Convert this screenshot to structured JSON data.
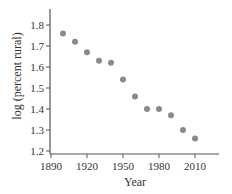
{
  "chart_data": {
    "type": "scatter",
    "title": "",
    "xlabel": "Year",
    "ylabel": "log (percent rural)",
    "xlim": [
      1890,
      2025
    ],
    "ylim": [
      1.19,
      1.88
    ],
    "x_ticks": [
      1890,
      1920,
      1950,
      1980,
      2010
    ],
    "y_ticks": [
      1.2,
      1.3,
      1.4,
      1.5,
      1.6,
      1.7,
      1.8
    ],
    "x_tick_labels": [
      "1890",
      "1920",
      "1950",
      "1980",
      "2010"
    ],
    "y_tick_labels": [
      "1.2",
      "1.3",
      "1.4",
      "1.5",
      "1.6",
      "1.7",
      "1.8"
    ],
    "grid": false,
    "legend": null,
    "series": [
      {
        "name": "log (percent rural)",
        "x": [
          1900,
          1910,
          1920,
          1930,
          1940,
          1950,
          1960,
          1970,
          1980,
          1990,
          2000,
          2010
        ],
        "values": [
          1.76,
          1.72,
          1.67,
          1.63,
          1.62,
          1.54,
          1.46,
          1.4,
          1.4,
          1.37,
          1.3,
          1.26
        ]
      }
    ]
  },
  "colors": {
    "axis": "#555555",
    "point": "#8a8a8a",
    "text": "#333333"
  }
}
